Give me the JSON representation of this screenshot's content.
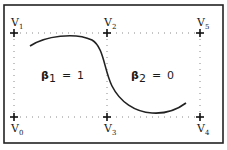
{
  "diagram": {
    "frame": {
      "x": 4,
      "y": 5,
      "width": 219,
      "height": 138,
      "stroke": "#222222"
    },
    "grid": {
      "x_left": 14,
      "x_mid": 107,
      "x_right": 200,
      "y_top": 33,
      "y_bottom": 117,
      "style": "dotted",
      "color": "#8a8a8a"
    },
    "vertices": [
      {
        "id": "V0",
        "label": "V",
        "sub": "0",
        "x": 14,
        "y": 117,
        "label_pos": "below"
      },
      {
        "id": "V1",
        "label": "V",
        "sub": "1",
        "x": 14,
        "y": 33,
        "label_pos": "above"
      },
      {
        "id": "V2",
        "label": "V",
        "sub": "2",
        "x": 107,
        "y": 33,
        "label_pos": "above"
      },
      {
        "id": "V3",
        "label": "V",
        "sub": "3",
        "x": 107,
        "y": 117,
        "label_pos": "below"
      },
      {
        "id": "V4",
        "label": "V",
        "sub": "4",
        "x": 200,
        "y": 117,
        "label_pos": "below"
      },
      {
        "id": "V5",
        "label": "V",
        "sub": "5",
        "x": 200,
        "y": 33,
        "label_pos": "above"
      }
    ],
    "regions": [
      {
        "symbol": "β",
        "sub": "1",
        "equals": "=",
        "value": "1"
      },
      {
        "symbol": "β",
        "sub": "2",
        "equals": "=",
        "value": "0"
      }
    ],
    "curve": {
      "description": "smooth S-shaped curve from upper-left region down to lower-right region",
      "color": "#222222"
    }
  }
}
